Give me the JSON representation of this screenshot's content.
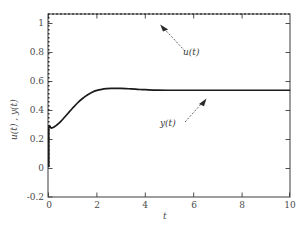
{
  "chart_data": {
    "type": "line",
    "title": "",
    "xlabel": "t",
    "ylabel": "u(t) , y(t)",
    "xlim": [
      0,
      10
    ],
    "ylim": [
      -0.2,
      1.0
    ],
    "xticks": [
      "0",
      "2",
      "4",
      "6",
      "8",
      "10"
    ],
    "xtick_values": [
      0,
      2,
      4,
      6,
      8,
      10
    ],
    "yticks": [
      "1",
      "0.8",
      "0.6",
      "0.4",
      "0.2",
      "0",
      "-0.2"
    ],
    "ytick_values": [
      1,
      0.8,
      0.6,
      0.4,
      0.2,
      0,
      -0.2
    ],
    "grid": false,
    "legend": "none",
    "annotations": [
      {
        "text": "u(t)",
        "points_to_series": "u(t)",
        "x": 4.7,
        "y": 1.0
      },
      {
        "text": "y(t)",
        "points_to_series": "y(t)",
        "x": 6.3,
        "y": 0.5
      }
    ],
    "series": [
      {
        "name": "u(t)",
        "style": "dotted",
        "color": "#1a1a1a",
        "x": [
          0,
          0,
          0.2,
          0.4,
          0.6,
          0.8,
          1,
          1.5,
          2,
          2.5,
          3,
          3.5,
          4,
          4.5,
          5,
          5.5,
          6,
          6.5,
          7,
          7.5,
          8,
          8.5,
          9,
          9.5,
          10
        ],
        "values": [
          0,
          1,
          1,
          1,
          1,
          1,
          1,
          1,
          1,
          1,
          1,
          1,
          1,
          1,
          1,
          1,
          1,
          1,
          1,
          1,
          1,
          1,
          1,
          1,
          1
        ]
      },
      {
        "name": "y(t)",
        "style": "solid",
        "color": "#1a1a1a",
        "x": [
          0,
          0,
          0.1,
          0.2,
          0.3,
          0.4,
          0.5,
          0.6,
          0.7,
          0.8,
          0.9,
          1.0,
          1.2,
          1.4,
          1.6,
          1.8,
          2.0,
          2.2,
          2.4,
          2.6,
          2.8,
          3.0,
          3.2,
          3.4,
          3.6,
          3.8,
          4.0,
          4.5,
          5.0,
          5.5,
          6.0,
          6.5,
          7.0,
          7.5,
          8.0,
          8.5,
          9.0,
          9.5,
          10.0
        ],
        "values": [
          0,
          0.25,
          0.252,
          0.258,
          0.268,
          0.281,
          0.296,
          0.313,
          0.331,
          0.349,
          0.367,
          0.385,
          0.418,
          0.446,
          0.469,
          0.487,
          0.499,
          0.506,
          0.51,
          0.512,
          0.512,
          0.512,
          0.511,
          0.509,
          0.507,
          0.505,
          0.504,
          0.501,
          0.5,
          0.5,
          0.5,
          0.5,
          0.5,
          0.5,
          0.5,
          0.5,
          0.5,
          0.5,
          0.5
        ]
      }
    ]
  },
  "axes": {
    "frame_color": "#3c3c3c",
    "background": "#ffffff"
  }
}
